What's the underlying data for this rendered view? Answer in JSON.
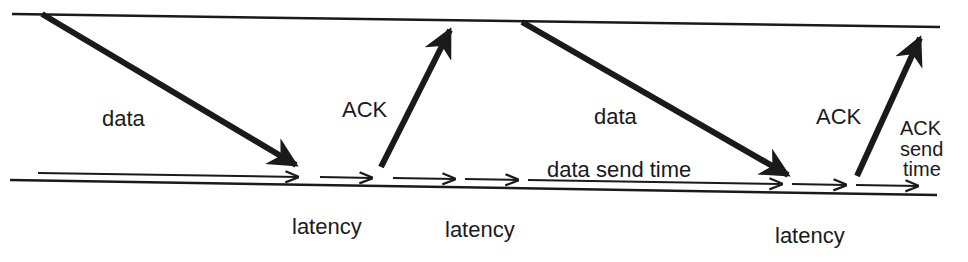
{
  "diagram": {
    "type": "timing-sequence",
    "labels": {
      "data_1": "data",
      "ack_1": "ACK",
      "data_2": "data",
      "ack_2": "ACK",
      "data_send_time": "data send time",
      "ack_send_time_line1": "ACK",
      "ack_send_time_line2": "send",
      "ack_send_time_line3": "time",
      "latency_1": "latency",
      "latency_2": "latency",
      "latency_3": "latency"
    },
    "timelines": [
      {
        "name": "sender",
        "x1": 12,
        "y1": 14,
        "x2": 940,
        "y2": 27
      },
      {
        "name": "receiver",
        "x1": 10,
        "y1": 180,
        "x2": 937,
        "y2": 195
      }
    ],
    "messages": [
      {
        "label": "data",
        "x1": 42,
        "y1": 14,
        "x2": 296,
        "y2": 165
      },
      {
        "label": "ACK",
        "x1": 381,
        "y1": 167,
        "x2": 450,
        "y2": 30
      },
      {
        "label": "data",
        "x1": 522,
        "y1": 22,
        "x2": 788,
        "y2": 175
      },
      {
        "label": "ACK",
        "x1": 857,
        "y1": 176,
        "x2": 920,
        "y2": 38
      }
    ],
    "intervals": [
      {
        "name": "data-send-time",
        "x1": 38,
        "y1": 173,
        "x2": 298,
        "y2": 177
      },
      {
        "name": "latency",
        "x1": 320,
        "y1": 177,
        "x2": 372,
        "y2": 178
      },
      {
        "name": "ack-send-time",
        "x1": 393,
        "y1": 178,
        "x2": 455,
        "y2": 179
      },
      {
        "name": "latency",
        "x1": 465,
        "y1": 179,
        "x2": 518,
        "y2": 180
      },
      {
        "name": "data-send-time",
        "x1": 528,
        "y1": 180,
        "x2": 782,
        "y2": 184
      },
      {
        "name": "latency",
        "x1": 792,
        "y1": 184,
        "x2": 846,
        "y2": 185
      },
      {
        "name": "ack-send-time",
        "x1": 856,
        "y1": 185,
        "x2": 918,
        "y2": 186
      }
    ],
    "colors": {
      "ink": "#1a1a1a",
      "background": "#ffffff"
    }
  }
}
